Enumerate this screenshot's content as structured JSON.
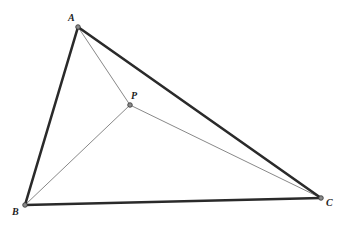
{
  "diagram": {
    "type": "geometry",
    "colors": {
      "background": "#ffffff",
      "triangle_stroke": "#2a2a2a",
      "cevian_stroke": "#6a6a6a",
      "point_fill": "#8a8a8a",
      "label": "#222222"
    },
    "points": {
      "A": {
        "label": "A",
        "x": 78,
        "y": 27,
        "label_x": 68,
        "label_y": 21
      },
      "B": {
        "label": "B",
        "x": 25,
        "y": 205,
        "label_x": 12,
        "label_y": 215
      },
      "C": {
        "label": "C",
        "x": 321,
        "y": 198,
        "label_x": 326,
        "label_y": 206
      },
      "P": {
        "label": "P",
        "x": 130,
        "y": 105,
        "label_x": 131,
        "label_y": 99
      }
    },
    "triangle_edges": [
      [
        "A",
        "B"
      ],
      [
        "B",
        "C"
      ],
      [
        "C",
        "A"
      ]
    ],
    "segments_from_P": [
      [
        "P",
        "A"
      ],
      [
        "P",
        "B"
      ],
      [
        "P",
        "C"
      ]
    ]
  }
}
